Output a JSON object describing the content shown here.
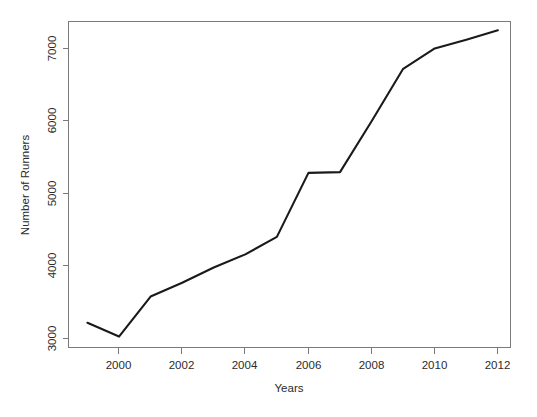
{
  "chart_data": {
    "type": "line",
    "title": "",
    "xlabel": "Years",
    "ylabel": "Number of Runners",
    "x": [
      1999,
      2000,
      2001,
      2002,
      2003,
      2004,
      2005,
      2006,
      2007,
      2008,
      2009,
      2010,
      2011,
      2012
    ],
    "values": [
      3200,
      3010,
      3560,
      3750,
      3960,
      4140,
      4380,
      5260,
      5270,
      5970,
      6690,
      6970,
      7090,
      7220
    ],
    "series": [
      {
        "name": "Number of Runners",
        "values": [
          3200,
          3010,
          3560,
          3750,
          3960,
          4140,
          4380,
          5260,
          5270,
          5970,
          6690,
          6970,
          7090,
          7220
        ]
      }
    ],
    "xlim": [
      1998.4,
      2012.4
    ],
    "ylim": [
      2860,
      7340
    ],
    "xticks": [
      2000,
      2002,
      2004,
      2006,
      2008,
      2010,
      2012
    ],
    "xtick_labels": [
      "2000",
      "2002",
      "2004",
      "2006",
      "2008",
      "2010",
      "2012"
    ],
    "yticks": [
      3000,
      4000,
      5000,
      6000,
      7000
    ],
    "ytick_labels": [
      "3000",
      "4000",
      "5000",
      "6000",
      "7000"
    ],
    "grid": false,
    "legend": false,
    "legend_position": "none",
    "line_color": "#1a1a1a",
    "axis_color": "#7a7a7a",
    "background_color": "#ffffff",
    "ytick_label_rotation": 90
  },
  "footer": {
    "clipped_text": ""
  }
}
